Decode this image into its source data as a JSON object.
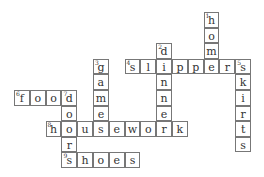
{
  "puzzle": {
    "type": "crossword",
    "cell_w": 15.8,
    "cell_h": 15.6,
    "origin_x": 14,
    "origin_y": 12,
    "words": [
      {
        "number": 1,
        "answer": "home",
        "direction": "down",
        "row": 0,
        "col": 12
      },
      {
        "number": 2,
        "answer": "dinner",
        "direction": "down",
        "row": 2,
        "col": 9
      },
      {
        "number": 3,
        "answer": "game",
        "direction": "down",
        "row": 3,
        "col": 5
      },
      {
        "number": 4,
        "answer": "slippers",
        "direction": "across",
        "row": 3,
        "col": 7
      },
      {
        "number": 5,
        "answer": "skirts",
        "direction": "down",
        "row": 3,
        "col": 14
      },
      {
        "number": 6,
        "answer": "food",
        "direction": "across",
        "row": 5,
        "col": 0
      },
      {
        "number": 7,
        "answer": "doors",
        "direction": "down",
        "row": 5,
        "col": 3
      },
      {
        "number": 8,
        "answer": "housework",
        "direction": "across",
        "row": 7,
        "col": 2
      },
      {
        "number": 9,
        "answer": "shoes",
        "direction": "across",
        "row": 9,
        "col": 3
      }
    ]
  }
}
